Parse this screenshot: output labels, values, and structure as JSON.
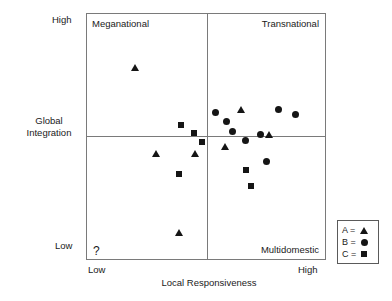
{
  "chart_data": {
    "type": "scatter",
    "title": "",
    "xlabel": "Local Responsiveness",
    "ylabel": "Global Integration",
    "xlim": [
      0,
      100
    ],
    "ylim": [
      0,
      100
    ],
    "grid": false,
    "x_ticks": [
      "Low",
      "High"
    ],
    "y_ticks": [
      "High",
      "Low"
    ],
    "quadrant_labels": {
      "top_left": "Meganational",
      "top_right": "Transnational",
      "bottom_right": "Multidomestic",
      "bottom_left": "?"
    },
    "quadrant_divider_x": 50,
    "quadrant_divider_y": 50,
    "legend": {
      "position": "outside-bottom-right",
      "entries": [
        {
          "label": "A =",
          "marker": "triangle"
        },
        {
          "label": "B =",
          "marker": "circle"
        },
        {
          "label": "C =",
          "marker": "square"
        }
      ]
    },
    "series": [
      {
        "name": "A",
        "marker": "triangle",
        "points": [
          {
            "x": 20.0,
            "y": 78.0,
            "quadrant": "top_left"
          },
          {
            "x": 64.5,
            "y": 61.0,
            "quadrant": "top_right"
          },
          {
            "x": 76.5,
            "y": 50.8,
            "quadrant": "top_right"
          },
          {
            "x": 29.0,
            "y": 43.0,
            "quadrant": "bottom_left"
          },
          {
            "x": 45.5,
            "y": 43.0,
            "quadrant": "bottom_left"
          },
          {
            "x": 58.0,
            "y": 45.8,
            "quadrant": "bottom_right"
          },
          {
            "x": 38.5,
            "y": 11.0,
            "quadrant": "bottom_left"
          }
        ]
      },
      {
        "name": "B",
        "marker": "circle",
        "points": [
          {
            "x": 54.0,
            "y": 60.0,
            "quadrant": "top_right"
          },
          {
            "x": 58.5,
            "y": 56.0,
            "quadrant": "top_right"
          },
          {
            "x": 61.0,
            "y": 52.0,
            "quadrant": "top_right"
          },
          {
            "x": 66.5,
            "y": 48.5,
            "quadrant": "top_right"
          },
          {
            "x": 73.0,
            "y": 51.0,
            "quadrant": "top_right"
          },
          {
            "x": 80.5,
            "y": 61.0,
            "quadrant": "top_right"
          },
          {
            "x": 87.5,
            "y": 59.0,
            "quadrant": "top_right"
          },
          {
            "x": 75.5,
            "y": 40.0,
            "quadrant": "bottom_right"
          }
        ]
      },
      {
        "name": "C",
        "marker": "square",
        "points": [
          {
            "x": 39.5,
            "y": 54.5,
            "quadrant": "top_left"
          },
          {
            "x": 45.0,
            "y": 51.5,
            "quadrant": "top_left"
          },
          {
            "x": 48.5,
            "y": 47.8,
            "quadrant": "top_left"
          },
          {
            "x": 38.5,
            "y": 34.5,
            "quadrant": "bottom_left"
          },
          {
            "x": 67.0,
            "y": 36.5,
            "quadrant": "bottom_right"
          },
          {
            "x": 69.0,
            "y": 30.0,
            "quadrant": "bottom_right"
          }
        ]
      }
    ]
  },
  "axes": {
    "y_title": "Global Integration",
    "y_high": "High",
    "y_low": "Low",
    "x_low": "Low",
    "x_high": "High",
    "x_title": "Local Responsiveness"
  },
  "quadrants": {
    "meganational": "Meganational",
    "transnational": "Transnational",
    "multidomestic": "Multidomestic",
    "unknown": "?"
  },
  "legend": {
    "a_label": "A =",
    "b_label": "B =",
    "c_label": "C ="
  },
  "colors": {
    "marker": "#151515",
    "frame": "#7a7a7a",
    "text": "#1a1a1a",
    "background": "#ffffff"
  }
}
